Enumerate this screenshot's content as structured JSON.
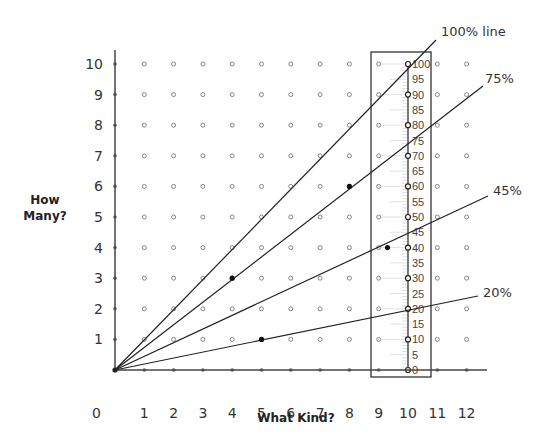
{
  "chart_data": {
    "type": "line",
    "title": "",
    "xlabel": "What Kind?",
    "ylabel": "How Many?",
    "xlim": [
      0,
      12
    ],
    "ylim": [
      0,
      10
    ],
    "x_ticks": [
      "0",
      "1",
      "2",
      "3",
      "4",
      "5",
      "6",
      "7",
      "8",
      "9",
      "10",
      "11",
      "12"
    ],
    "y_ticks": [
      "1",
      "2",
      "3",
      "4",
      "5",
      "6",
      "7",
      "8",
      "9",
      "10"
    ],
    "grid": "dot-lattice",
    "series": [
      {
        "name": "100% line",
        "slope": 1.0,
        "points": [
          [
            0,
            0
          ],
          [
            10,
            10
          ]
        ]
      },
      {
        "name": "75%",
        "slope": 0.75,
        "points": [
          [
            0,
            0
          ],
          [
            4,
            3
          ],
          [
            8,
            6
          ],
          [
            12,
            9
          ]
        ]
      },
      {
        "name": "45%",
        "slope": 0.45,
        "points": [
          [
            0,
            0
          ],
          [
            10,
            4.5
          ],
          [
            12,
            5.4
          ]
        ]
      },
      {
        "name": "20%",
        "slope": 0.2,
        "points": [
          [
            0,
            0
          ],
          [
            5,
            1
          ],
          [
            10,
            2
          ],
          [
            12,
            2.4
          ]
        ]
      }
    ],
    "highlighted_points": [
      [
        4,
        3
      ],
      [
        5,
        1
      ],
      [
        8,
        6
      ],
      [
        9.3,
        4
      ]
    ],
    "percent_ruler": {
      "x_position": 10,
      "labels": [
        "100",
        "95",
        "90",
        "85",
        "80",
        "75",
        "70",
        "65",
        "60",
        "55",
        "50",
        "45",
        "40",
        "35",
        "30",
        "25",
        "20",
        "15",
        "10",
        "5",
        "0"
      ]
    }
  },
  "labels": {
    "origin": "0",
    "y_title_line1": "How",
    "y_title_line2": "Many?",
    "x_title": "What Kind?",
    "line_100": "100% line",
    "line_75": "75%",
    "line_45": "45%",
    "line_20": "20%"
  }
}
